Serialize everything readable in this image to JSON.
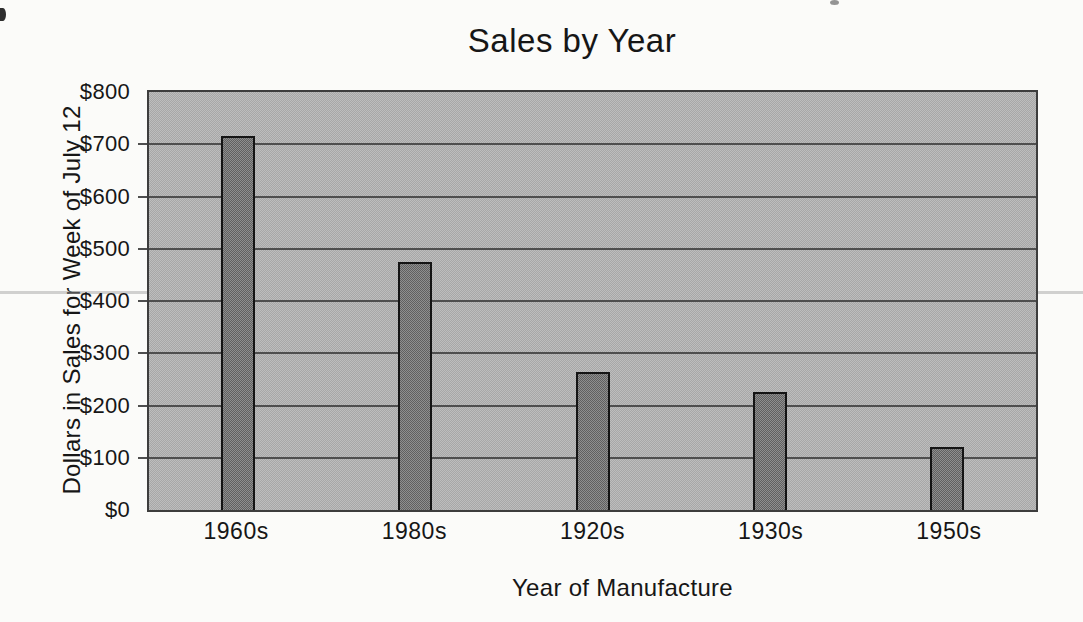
{
  "chart_data": {
    "type": "bar",
    "title": "Sales by Year",
    "xlabel": "Year of Manufacture",
    "ylabel": "Dollars in Sales for Week of July 12",
    "categories": [
      "1960s",
      "1980s",
      "1920s",
      "1930s",
      "1950s"
    ],
    "values": [
      715,
      475,
      265,
      225,
      120
    ],
    "ylim": [
      0,
      800
    ],
    "ytick_step": 100,
    "ytick_labels": [
      "$0",
      "$100",
      "$200",
      "$300",
      "$400",
      "$500",
      "$600",
      "$700",
      "$800"
    ],
    "grid": true,
    "legend": false,
    "plot_fill": [
      "#bdbdbd",
      "#a7a7a7"
    ],
    "bar_fill": [
      "#8f8f8f",
      "#606060"
    ],
    "bar_border_color": "#141414",
    "gridline_color": "#4f4f4f",
    "axis_border_color": "#3d3d3d",
    "text_color": "#161616",
    "page_background": "#fbfbf9"
  }
}
